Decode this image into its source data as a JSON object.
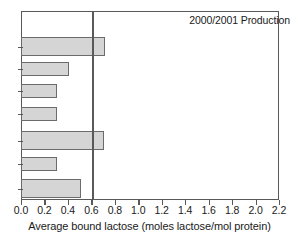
{
  "chart_data": {
    "type": "bar",
    "orientation": "horizontal",
    "title": "",
    "annotation": "2000/2001 Production",
    "xlabel": "Average bound lactose (moles lactose/mol protein)",
    "ylabel": "",
    "xlim": [
      0.0,
      2.2
    ],
    "xticks": [
      "0.0",
      "0.2",
      "0.4",
      "0.6",
      "0.8",
      "1.0",
      "1.2",
      "1.4",
      "1.6",
      "1.8",
      "2.0",
      "2.2"
    ],
    "xtick_values": [
      0.0,
      0.2,
      0.4,
      0.6,
      0.8,
      1.0,
      1.2,
      1.4,
      1.6,
      1.8,
      2.0,
      2.2
    ],
    "yticks": [
      "",
      "",
      "",
      "",
      "",
      "",
      ""
    ],
    "grid": false,
    "legend": null,
    "reference_line": {
      "axis": "x",
      "value": 0.6,
      "color": "#595959"
    },
    "bar_color": "#d5d5d5",
    "bar_edge_color": "#6b6b6b",
    "categories": [
      "1",
      "2",
      "3",
      "4",
      "5",
      "6",
      "7"
    ],
    "values": [
      0.71,
      0.4,
      0.3,
      0.3,
      0.7,
      0.3,
      0.5
    ],
    "bars": [
      {
        "value": 0.71,
        "top": 25,
        "height": 19
      },
      {
        "value": 0.4,
        "top": 50,
        "height": 14
      },
      {
        "value": 0.3,
        "top": 72,
        "height": 14
      },
      {
        "value": 0.3,
        "top": 95,
        "height": 14
      },
      {
        "value": 0.7,
        "top": 119,
        "height": 19
      },
      {
        "value": 0.3,
        "top": 145,
        "height": 14
      },
      {
        "value": 0.5,
        "top": 167,
        "height": 19
      }
    ]
  }
}
